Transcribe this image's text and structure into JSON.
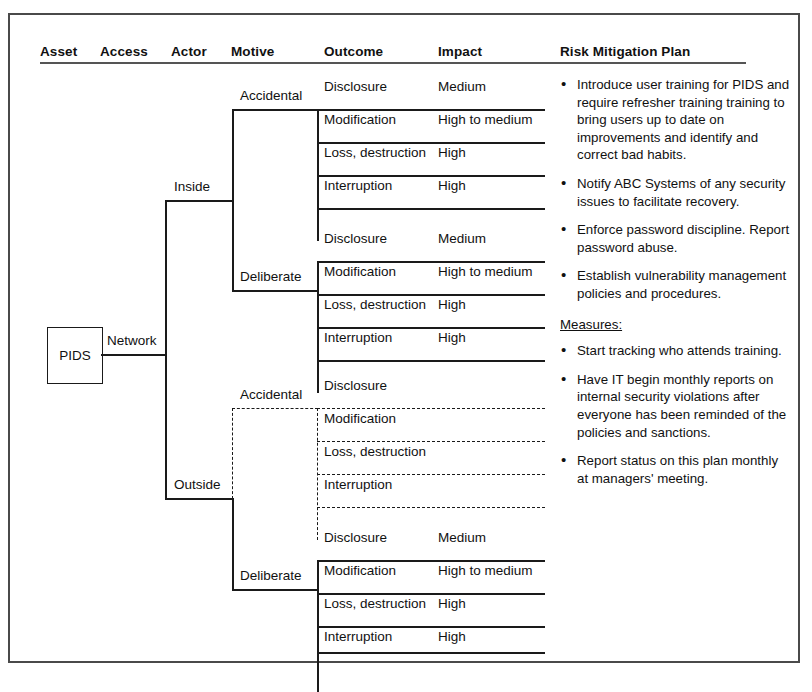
{
  "frame": {
    "present": true
  },
  "headers": [
    {
      "key": "asset",
      "label": "Asset",
      "x": 40
    },
    {
      "key": "access",
      "label": "Access",
      "x": 100
    },
    {
      "key": "actor",
      "label": "Actor",
      "x": 171
    },
    {
      "key": "motive",
      "label": "Motive",
      "x": 231
    },
    {
      "key": "outcome",
      "label": "Outcome",
      "x": 324
    },
    {
      "key": "impact",
      "label": "Impact",
      "x": 438
    },
    {
      "key": "plan",
      "label": "Risk Mitigation Plan",
      "x": 560
    }
  ],
  "asset": {
    "label": "PIDS"
  },
  "access": {
    "label": "Network"
  },
  "actors": [
    {
      "label": "Inside",
      "style": "solid"
    },
    {
      "label": "Outside",
      "style": "solid"
    }
  ],
  "motives": [
    {
      "actor": "Inside",
      "label": "Accidental",
      "style": "solid"
    },
    {
      "actor": "Inside",
      "label": "Deliberate",
      "style": "solid"
    },
    {
      "actor": "Outside",
      "label": "Accidental",
      "style": "dashed"
    },
    {
      "actor": "Outside",
      "label": "Deliberate",
      "style": "solid"
    }
  ],
  "groups": [
    {
      "id": "inside-accidental",
      "actor": "Inside",
      "motive": "Accidental",
      "style": "solid",
      "rows": [
        {
          "outcome": "Disclosure",
          "impact": "Medium"
        },
        {
          "outcome": "Modification",
          "impact": "High to medium"
        },
        {
          "outcome": "Loss, destruction",
          "impact": "High"
        },
        {
          "outcome": "Interruption",
          "impact": "High"
        }
      ]
    },
    {
      "id": "inside-deliberate",
      "actor": "Inside",
      "motive": "Deliberate",
      "style": "solid",
      "rows": [
        {
          "outcome": "Disclosure",
          "impact": "Medium"
        },
        {
          "outcome": "Modification",
          "impact": "High to medium"
        },
        {
          "outcome": "Loss, destruction",
          "impact": "High"
        },
        {
          "outcome": "Interruption",
          "impact": "High"
        }
      ]
    },
    {
      "id": "outside-accidental",
      "actor": "Outside",
      "motive": "Accidental",
      "style": "dashed",
      "rows": [
        {
          "outcome": "Disclosure",
          "impact": ""
        },
        {
          "outcome": "Modification",
          "impact": ""
        },
        {
          "outcome": "Loss, destruction",
          "impact": ""
        },
        {
          "outcome": "Interruption",
          "impact": ""
        }
      ]
    },
    {
      "id": "outside-deliberate",
      "actor": "Outside",
      "motive": "Deliberate",
      "style": "solid",
      "rows": [
        {
          "outcome": "Disclosure",
          "impact": "Medium"
        },
        {
          "outcome": "Modification",
          "impact": "High to medium"
        },
        {
          "outcome": "Loss, destruction",
          "impact": "High"
        },
        {
          "outcome": "Interruption",
          "impact": "High"
        }
      ]
    }
  ],
  "plan": {
    "blocks": [
      {
        "type": "bullet",
        "text": "Introduce user training for PIDS and require refresher training training to bring users up to date on improvements and identify and correct bad habits."
      },
      {
        "type": "bullet",
        "text": "Notify ABC Systems of any security issues to facilitate recovery."
      },
      {
        "type": "bullet",
        "text": "Enforce password discipline. Report password abuse."
      },
      {
        "type": "bullet",
        "text": "Establish vulnerability management policies and procedures."
      },
      {
        "type": "heading",
        "text": "Measures:"
      },
      {
        "type": "bullet",
        "text": "Start tracking who attends training."
      },
      {
        "type": "bullet",
        "text": "Have IT begin monthly reports on internal security violations after everyone has been reminded of the policies and sanctions."
      },
      {
        "type": "bullet",
        "text": "Report status on this plan monthly at managers' meeting."
      }
    ],
    "bullet_glyph": "•"
  },
  "geometry": {
    "group_tops": [
      76,
      228,
      375,
      527
    ],
    "row_height": 33,
    "outcome_x": 324,
    "impact_x": 438,
    "bracket_x": 317,
    "rule_left": 317,
    "rule_right": 545,
    "trunk_x": 165,
    "sub_trunk_x": 232
  }
}
